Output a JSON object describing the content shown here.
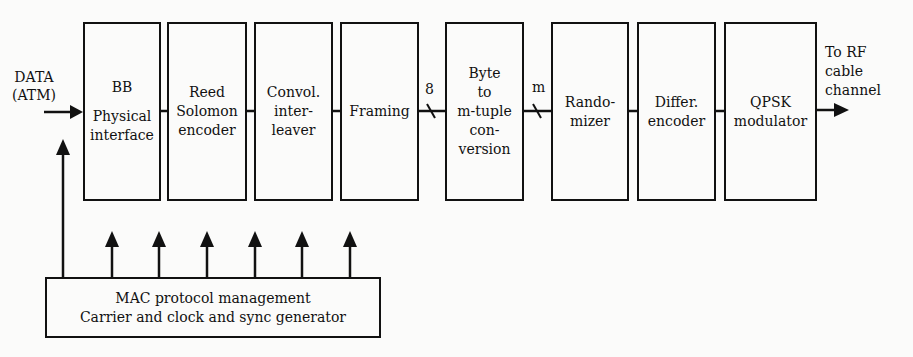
{
  "input": {
    "label_line1": "DATA",
    "label_line2": "(ATM)"
  },
  "blocks": [
    {
      "id": "bb-physical-interface",
      "lines": [
        "BB",
        "",
        "Physical",
        "interface"
      ]
    },
    {
      "id": "reed-solomon-encoder",
      "lines": [
        "Reed",
        "Solomon",
        "encoder"
      ]
    },
    {
      "id": "convol-interleaver",
      "lines": [
        "Convol.",
        "inter-",
        "leaver"
      ]
    },
    {
      "id": "framing",
      "lines": [
        "Framing"
      ]
    },
    {
      "id": "byte-to-m-tuple",
      "lines": [
        "Byte",
        "to",
        "m-tuple",
        "con-",
        "version"
      ]
    },
    {
      "id": "randomizer",
      "lines": [
        "Rando-",
        "mizer"
      ]
    },
    {
      "id": "differ-encoder",
      "lines": [
        "Differ.",
        "encoder"
      ]
    },
    {
      "id": "qpsk-modulator",
      "lines": [
        "QPSK",
        "modulator"
      ]
    }
  ],
  "bus_labels": {
    "framing_to_byte": "8",
    "byte_to_randomizer": "m"
  },
  "output": {
    "label_line1": "To RF",
    "label_line2": "cable",
    "label_line3": "channel"
  },
  "control": {
    "line1": "MAC protocol management",
    "line2": "Carrier and clock and sync generator",
    "feeds_blocks": 6
  },
  "colors": {
    "ink": "#111111",
    "background": "#fbfbfa"
  }
}
